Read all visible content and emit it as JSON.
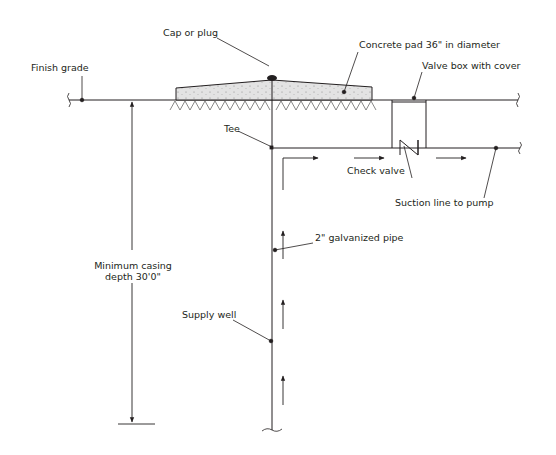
{
  "diagram": {
    "labels": {
      "cap": "Cap or plug",
      "concrete_pad": "Concrete pad 36\" in diameter",
      "finish_grade": "Finish grade",
      "valve_box": "Valve box with cover",
      "tee": "Tee",
      "check_valve": "Check valve",
      "suction_line": "Suction line to pump",
      "casing_line1": "Minimum casing",
      "casing_line2": "depth 30'0\"",
      "pipe": "2\" galvanized pipe",
      "supply_well": "Supply well"
    },
    "colors": {
      "line": "#231f20",
      "concrete_fill": "#e3e3e3",
      "background": "#ffffff"
    },
    "flow_direction_arrows": [
      "up",
      "up",
      "up",
      "right",
      "right",
      "right"
    ]
  }
}
